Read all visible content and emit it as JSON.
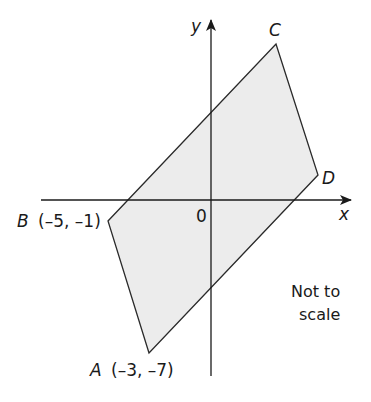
{
  "diagram": {
    "type": "coordinate-geometry",
    "shape": "parallelogram ABCD",
    "fill_color": "#ececec",
    "stroke_color": "#2a2a2a",
    "axes": {
      "x_label": "x",
      "y_label": "y",
      "origin_label": "0"
    },
    "vertices": [
      {
        "name": "A",
        "coords": "(–3, –7)",
        "px": [
          149,
          353
        ]
      },
      {
        "name": "B",
        "coords": "(–5, –1)",
        "px": [
          108,
          221
        ]
      },
      {
        "name": "C",
        "coords": "",
        "px": [
          276,
          44
        ]
      },
      {
        "name": "D",
        "coords": "",
        "px": [
          318,
          175
        ]
      }
    ],
    "labels": {
      "A": "A",
      "A_coords": "(–3, –7)",
      "B": "B",
      "B_coords": "(–5, –1)",
      "C": "C",
      "D": "D"
    },
    "note_line1": "Not to",
    "note_line2": "scale"
  }
}
